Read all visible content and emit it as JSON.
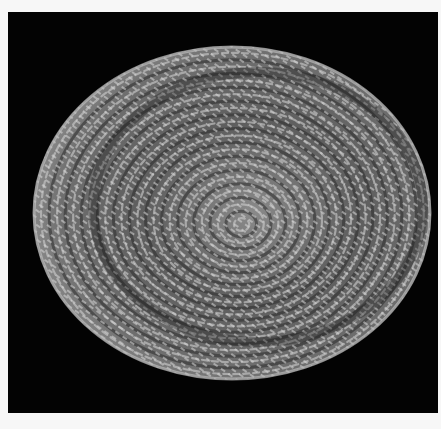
{
  "image": {
    "subject": "coiled woven basket, top-down view",
    "background_color": "#030303",
    "border_color": "#f7f7f7",
    "palette": {
      "highlight": "#d8d8d8",
      "mid": "#7a7a7a",
      "shadow": "#2a2a2a",
      "rim_light": "#bdbdbd"
    },
    "basket": {
      "center_x": 224,
      "center_y": 201,
      "radius_x": 199,
      "radius_y": 167,
      "coil_rings": 26
    }
  }
}
